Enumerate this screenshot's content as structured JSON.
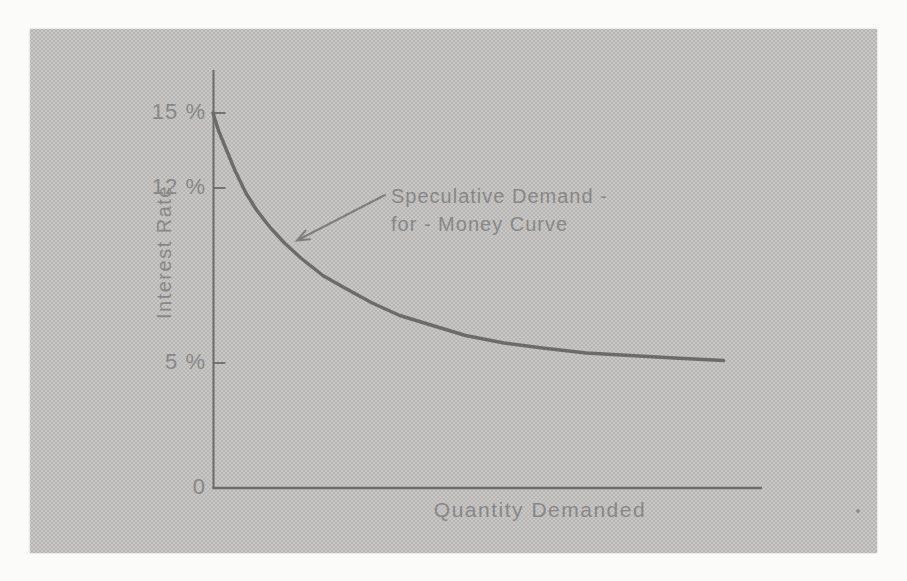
{
  "figure": {
    "y_axis": {
      "title": "Interest Rate",
      "tick_labels": [
        "15 %",
        "12 %",
        "5 %"
      ],
      "origin_label": "0"
    },
    "x_axis": {
      "title": "Quantity Demanded"
    },
    "annotation": {
      "line1": "Speculative Demand -",
      "line2": "for - Money Curve"
    }
  },
  "chart_data": {
    "type": "line",
    "title": "",
    "xlabel": "Quantity Demanded",
    "ylabel": "Interest Rate",
    "x_axis_unlabeled": true,
    "x_range_units": [
      0,
      100
    ],
    "ylim_pct": [
      0,
      16.8
    ],
    "y_tick_values_pct": [
      15,
      12,
      5
    ],
    "origin_value": 0,
    "grid": false,
    "legend": "none",
    "series": [
      {
        "name": "Speculative Demand-for-Money Curve",
        "points": [
          [
            0,
            15.0
          ],
          [
            1,
            14.3
          ],
          [
            2.5,
            13.5
          ],
          [
            4,
            12.7
          ],
          [
            6,
            11.8
          ],
          [
            8,
            11.1
          ],
          [
            10.5,
            10.4
          ],
          [
            13,
            9.8
          ],
          [
            16,
            9.2
          ],
          [
            20,
            8.5
          ],
          [
            24,
            8.0
          ],
          [
            29,
            7.4
          ],
          [
            34,
            6.9
          ],
          [
            40,
            6.5
          ],
          [
            46,
            6.1
          ],
          [
            53,
            5.8
          ],
          [
            60,
            5.6
          ],
          [
            68,
            5.4
          ],
          [
            76,
            5.3
          ],
          [
            84,
            5.2
          ],
          [
            93,
            5.1
          ]
        ]
      }
    ],
    "annotations": [
      {
        "text": "Speculative Demand - for - Money Curve",
        "arrow_points_to_xy": [
          15,
          9.5
        ]
      }
    ],
    "asymptote_note": "curve decays from 15% toward 5%"
  },
  "colors": {
    "paper": "#fbfbfa",
    "panel_bg": "#cbcac8",
    "panel_dot": "#b5b3b1",
    "ink": "#6b6b6b",
    "text": "#878787"
  }
}
